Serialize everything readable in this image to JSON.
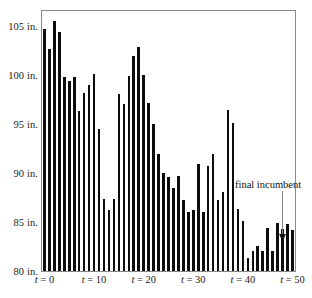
{
  "chart_data": {
    "type": "bar",
    "title": "",
    "subtitle": "",
    "xlabel": "",
    "ylabel": "",
    "unit": "in.",
    "xlim": [
      -0.5,
      50.5
    ],
    "ylim": [
      80,
      106.5
    ],
    "grid": false,
    "legend": null,
    "x_tick_labels": [
      "t = 0",
      "t = 10",
      "t = 20",
      "t = 30",
      "t = 40",
      "t = 50"
    ],
    "x_tick_values": [
      0,
      10,
      20,
      30,
      40,
      50
    ],
    "y_tick_labels": [
      "80 in.",
      "85 in.",
      "90 in.",
      "95 in.",
      "100 in.",
      "105 in."
    ],
    "y_tick_values": [
      80,
      85,
      90,
      95,
      100,
      105
    ],
    "bar_color": "#0d0d0d",
    "baseline": 80,
    "x": [
      0,
      1,
      2,
      3,
      4,
      5,
      6,
      7,
      8,
      9,
      10,
      11,
      12,
      13,
      14,
      15,
      16,
      17,
      18,
      19,
      20,
      21,
      22,
      23,
      24,
      25,
      26,
      27,
      28,
      29,
      30,
      31,
      32,
      33,
      34,
      35,
      36,
      37,
      38,
      39,
      40,
      41,
      42,
      43,
      44,
      45,
      46,
      47,
      48,
      49,
      50
    ],
    "values": [
      104.7,
      102.6,
      105.5,
      104.4,
      99.8,
      99.4,
      99.8,
      96.3,
      98.1,
      99.0,
      100.1,
      94.5,
      87.3,
      86.2,
      87.3,
      98.0,
      97.0,
      99.9,
      101.9,
      102.8,
      100.0,
      97.1,
      95.0,
      91.9,
      90.0,
      89.6,
      88.5,
      89.7,
      87.2,
      86.0,
      86.2,
      90.9,
      86.0,
      90.7,
      91.9,
      87.2,
      88.1,
      96.4,
      95.1,
      86.3,
      85.1,
      81.3,
      82.0,
      82.5,
      82.0,
      84.4,
      82.0,
      84.9,
      84.3,
      84.8,
      84.2
    ],
    "annotations": [
      {
        "text": "final incumbent",
        "points_to_x": 40,
        "points_to_y": 85.1,
        "arrow": "down"
      }
    ]
  },
  "figure": {
    "background_color": "#ffffff",
    "frame_color": "#8a8a8a"
  }
}
